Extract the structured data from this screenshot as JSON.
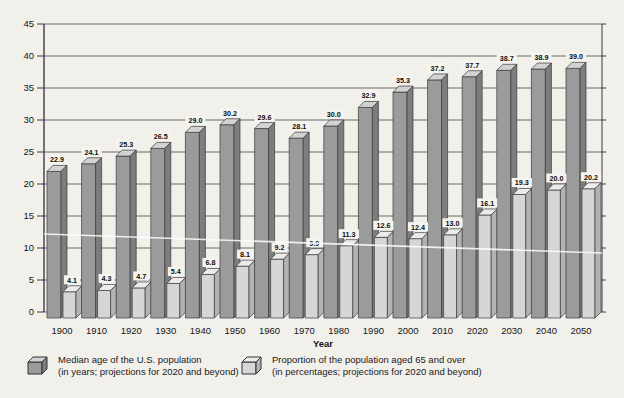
{
  "page": {
    "background": "#f2f0eb",
    "kind": "scanned textbook statistical chart"
  },
  "chart_data": {
    "type": "bar",
    "title": "",
    "xlabel": "Year",
    "ylabel": "",
    "ylim": [
      0,
      45
    ],
    "ytick_step": 5,
    "grid": true,
    "legend_position": "bottom",
    "categories": [
      "1900",
      "1910",
      "1920",
      "1930",
      "1940",
      "1950",
      "1960",
      "1970",
      "1980",
      "1990",
      "2000",
      "2010",
      "2020",
      "2030",
      "2040",
      "2050"
    ],
    "series": [
      {
        "name": "Median age of the U.S. population",
        "note": "(in years; projections for 2020 and beyond)",
        "values": [
          22.9,
          24.1,
          25.3,
          26.5,
          29.0,
          30.2,
          29.6,
          28.1,
          30.0,
          32.9,
          35.3,
          37.2,
          37.7,
          38.7,
          38.9,
          39.0
        ],
        "labels": [
          "22.9",
          "24.1",
          "25.3",
          "26.5",
          "29.0",
          "30.2",
          "29.6",
          "28.1",
          "30.0",
          "32.9",
          "35.3",
          "37.2",
          "37.7",
          "38.7",
          "38.9",
          "39.0"
        ],
        "color_front": "#9b9b9b",
        "color_side": "#7d7d7d",
        "color_top": "#d2d2d2"
      },
      {
        "name": "Proportion of the population aged 65 and over",
        "note": "(in percentages; projections for 2020 and beyond)",
        "values": [
          4.1,
          4.3,
          4.7,
          5.4,
          6.8,
          8.1,
          9.2,
          9.9,
          11.3,
          12.6,
          12.4,
          13.0,
          16.1,
          19.3,
          20.0,
          20.2
        ],
        "labels": [
          "4.1",
          "4.3",
          "4.7",
          "5.4",
          "6.8",
          "8.1",
          "9.2",
          "9.9",
          "11.3",
          "12.6",
          "12.4",
          "13.0",
          "16.1",
          "19.3",
          "20.0",
          "20.2"
        ],
        "color_front": "#d6d6d6",
        "color_side": "#b3b3b3",
        "color_top": "#ececec"
      }
    ],
    "axis_color": "#3d3d3d",
    "gridline_color": "#5a5a5a",
    "label_color": "#141414"
  }
}
